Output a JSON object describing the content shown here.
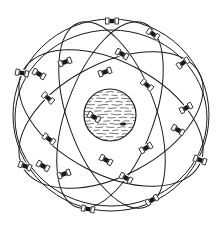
{
  "figure": {
    "stroke_color": "#1a1a1a",
    "background": "#ffffff",
    "earth": {
      "cx": 110,
      "cy": 115,
      "r": 26
    },
    "orbits": [
      {
        "cx": 111,
        "cy": 115,
        "rx": 98,
        "ry": 96,
        "rot": 0
      },
      {
        "cx": 111,
        "cy": 120,
        "rx": 100,
        "ry": 56,
        "rot": -28
      },
      {
        "cx": 111,
        "cy": 118,
        "rx": 100,
        "ry": 56,
        "rot": 28
      },
      {
        "cx": 110,
        "cy": 115,
        "rx": 98,
        "ry": 44,
        "rot": -70
      },
      {
        "cx": 112,
        "cy": 115,
        "rx": 98,
        "ry": 44,
        "rot": 70
      },
      {
        "cx": 111,
        "cy": 118,
        "rx": 96,
        "ry": 88,
        "rot": 0
      }
    ],
    "satellites": [
      {
        "x": 112,
        "y": 21,
        "rot": 0
      },
      {
        "x": 153,
        "y": 34,
        "rot": 35
      },
      {
        "x": 122,
        "y": 54,
        "rot": 30
      },
      {
        "x": 183,
        "y": 63,
        "rot": -35
      },
      {
        "x": 65,
        "y": 62,
        "rot": -20
      },
      {
        "x": 22,
        "y": 73,
        "rot": 10
      },
      {
        "x": 39,
        "y": 74,
        "rot": 30
      },
      {
        "x": 105,
        "y": 72,
        "rot": -20
      },
      {
        "x": 147,
        "y": 85,
        "rot": 40
      },
      {
        "x": 48,
        "y": 98,
        "rot": 40
      },
      {
        "x": 186,
        "y": 108,
        "rot": -30
      },
      {
        "x": 94,
        "y": 117,
        "rot": 30
      },
      {
        "x": 178,
        "y": 130,
        "rot": 30
      },
      {
        "x": 49,
        "y": 139,
        "rot": 35
      },
      {
        "x": 146,
        "y": 148,
        "rot": -30
      },
      {
        "x": 106,
        "y": 160,
        "rot": 30
      },
      {
        "x": 25,
        "y": 166,
        "rot": 20
      },
      {
        "x": 43,
        "y": 166,
        "rot": 30
      },
      {
        "x": 64,
        "y": 174,
        "rot": -20
      },
      {
        "x": 200,
        "y": 160,
        "rot": 20
      },
      {
        "x": 126,
        "y": 178,
        "rot": 30
      },
      {
        "x": 152,
        "y": 200,
        "rot": -30
      },
      {
        "x": 88,
        "y": 209,
        "rot": 10
      }
    ]
  }
}
